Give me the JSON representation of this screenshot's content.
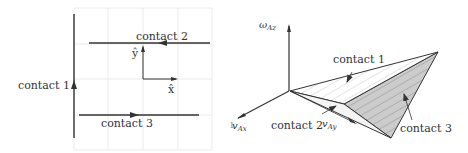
{
  "left_panel": {
    "grid_color": "#e6e6e6",
    "line_color": "#333333",
    "labels": {
      "contact1": "contact 1",
      "contact2": "contact 2",
      "contact3": "contact 3",
      "x_axis": "x̂",
      "y_axis": "ŷ",
      "stray": "ı"
    }
  },
  "right_panel": {
    "fill_color": "#cccccc",
    "line_color": "#333333",
    "labels": {
      "contact1": "contact 1",
      "contact2": "contact 2",
      "contact3": "contact 3",
      "omega_main": "ω",
      "omega_sub": "Az",
      "vx_main": "v",
      "vx_sub": "Ax",
      "vy_main": "v",
      "vy_sub": "Ay"
    }
  }
}
